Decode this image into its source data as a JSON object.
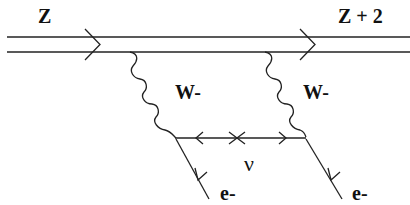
{
  "diagram": {
    "type": "feynman-diagram",
    "labels": {
      "nucleus_in": "Z",
      "nucleus_out": "Z + 2",
      "boson_left": "W-",
      "boson_right": "W-",
      "neutrino": "ν",
      "electron_left": "e-",
      "electron_right": "e-"
    },
    "colors": {
      "line": "#222222",
      "background": "#ffffff"
    }
  }
}
